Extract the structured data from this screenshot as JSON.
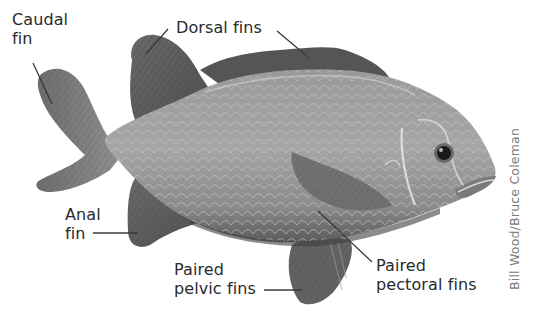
{
  "figure": {
    "colors": {
      "background": "#ffffff",
      "label_text": "#2a2a2a",
      "leader_line": "#3a3a3a",
      "credit_text": "#7a7a7a",
      "body": "#8c8c8c",
      "fin_dark": "#5e5e5e"
    }
  },
  "labels": {
    "caudal": {
      "line1": "Caudal",
      "line2": "fin"
    },
    "dorsal": {
      "line1": "Dorsal fins"
    },
    "anal": {
      "line1": "Anal",
      "line2": "fin"
    },
    "pelvic": {
      "line1": "Paired",
      "line2": "pelvic fins"
    },
    "pectoral": {
      "line1": "Paired",
      "line2": "pectoral fins"
    }
  },
  "credit": "Bill Wood/Bruce Coleman"
}
